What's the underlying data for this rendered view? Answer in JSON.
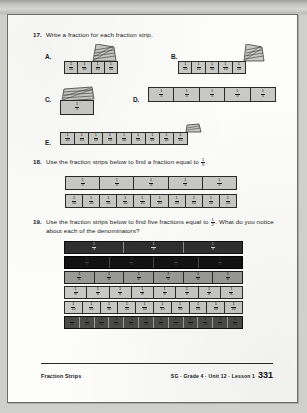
{
  "page": {
    "footer": {
      "left_label": "Fraction Strips",
      "right_label": "SG · Grade 4 · Unit 12 · Lesson 1",
      "page_number": "331"
    }
  },
  "problems": [
    {
      "number": "17.",
      "text": "Write a fraction for each fraction strip.",
      "parts": [
        {
          "label": "A.",
          "denominator": "10",
          "numerator": "1",
          "cells": 4,
          "covered": true
        },
        {
          "label": "B.",
          "denominator": "10",
          "numerator": "1",
          "cells": 5,
          "covered": true
        },
        {
          "label": "C.",
          "denominator": "5",
          "numerator": "1",
          "cells": 1,
          "covered": true
        },
        {
          "label": "D.",
          "denominator": "5",
          "numerator": "1",
          "cells": 5,
          "covered": false
        },
        {
          "label": "E.",
          "denominator": "10",
          "numerator": "1",
          "cells": 9,
          "covered": true
        }
      ]
    },
    {
      "number": "18.",
      "text_before": "Use the fraction strips below to find a fraction equal to",
      "target_numerator": "1",
      "target_denominator": "5",
      "text_after": ".",
      "strips": [
        {
          "numerator": "1",
          "denominator": "5",
          "cells": 5,
          "shade": "light"
        },
        {
          "numerator": "1",
          "denominator": "10",
          "cells": 10,
          "shade": "light"
        }
      ]
    },
    {
      "number": "19.",
      "text_before": "Use the fraction strips below to find five fractions equal to",
      "target_numerator": "1",
      "target_denominator": "2",
      "text_after": ". What do you notice about each of the denominators?",
      "strips": [
        {
          "numerator": "1",
          "denominator": "3",
          "cells": 3,
          "shade": "dark"
        },
        {
          "numerator": "1",
          "denominator": "4",
          "cells": 4,
          "shade": "verydark"
        },
        {
          "numerator": "1",
          "denominator": "6",
          "cells": 6,
          "shade": "mid"
        },
        {
          "numerator": "1",
          "denominator": "8",
          "cells": 8,
          "shade": "light"
        },
        {
          "numerator": "1",
          "denominator": "10",
          "cells": 10,
          "shade": "light"
        },
        {
          "numerator": "1",
          "denominator": "12",
          "cells": 12,
          "shade": "dark6"
        }
      ]
    }
  ],
  "icons": {
    "torn_flap": "torn-paper-flap-icon"
  }
}
